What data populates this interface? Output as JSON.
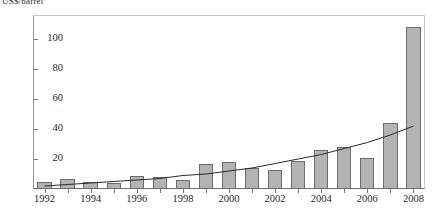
{
  "chart_data": {
    "type": "bar",
    "title": "",
    "axis_title_top": "US$/barrel",
    "xlabel": "",
    "ylabel": "US$/barrel",
    "ylim": [
      0,
      116
    ],
    "xlim": [
      1991.4,
      2008.7
    ],
    "grid": false,
    "legend": "none",
    "y_ticks": [
      20,
      40,
      60,
      80,
      100
    ],
    "x_ticks": [
      1992,
      1994,
      1996,
      1998,
      2000,
      2002,
      2004,
      2006,
      2008
    ],
    "categories": [
      "1992",
      "1993",
      "1994",
      "1995",
      "1996",
      "1997",
      "1998",
      "1999",
      "2000",
      "2001",
      "2002",
      "2003",
      "2004",
      "2005",
      "2006",
      "2007",
      "2008"
    ],
    "values": [
      5,
      7,
      5,
      4,
      9,
      8,
      6,
      17,
      18,
      14,
      13,
      19,
      26,
      28,
      21,
      44,
      108
    ],
    "series": [
      {
        "name": "Annual value",
        "type": "bar",
        "values": [
          5,
          7,
          5,
          4,
          9,
          8,
          6,
          17,
          18,
          14,
          13,
          19,
          26,
          28,
          21,
          44,
          108
        ]
      },
      {
        "name": "Trend",
        "type": "line",
        "values": [
          2,
          3,
          4,
          5,
          6,
          7,
          9,
          10,
          12,
          14,
          17,
          20,
          23,
          27,
          31,
          36,
          42
        ]
      }
    ],
    "bar_color": "#b3b3b3",
    "bar_edge_color": "#6b6b6b",
    "trend_color": "#2a2a2a"
  }
}
